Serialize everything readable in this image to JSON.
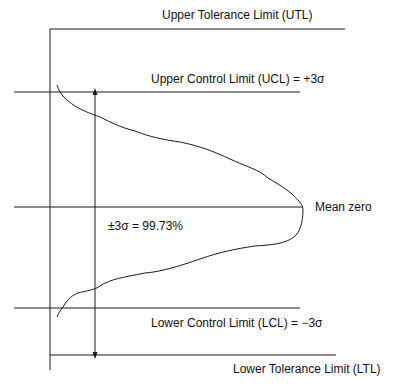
{
  "diagram": {
    "type": "control-chart-distribution",
    "lines": {
      "utl": {
        "label": "Upper Tolerance Limit (UTL)"
      },
      "ucl": {
        "label": "Upper Control Limit (UCL) = +3σ"
      },
      "mean": {
        "label": "Mean zero"
      },
      "lcl": {
        "label": "Lower Control Limit (LCL) = −3σ"
      },
      "ltl": {
        "label": "Lower Tolerance Limit (LTL)"
      }
    },
    "annotation": {
      "label": "±3σ = 99.73%"
    },
    "colors": {
      "line": "#1a1a1a",
      "background": "#ffffff"
    }
  }
}
